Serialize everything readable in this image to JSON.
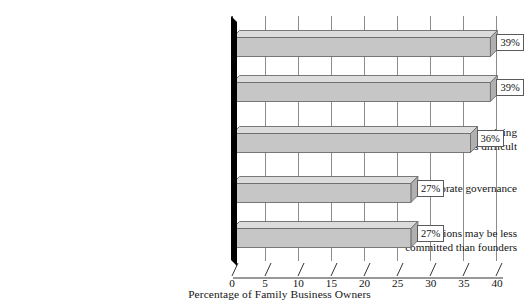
{
  "chart_data": {
    "type": "bar",
    "orientation": "horizontal",
    "style": "3d",
    "title": "",
    "xlabel": "Percentage of Family Business Owners",
    "ylabel": "",
    "xlim": [
      0,
      40
    ],
    "xticks": [
      0,
      5,
      10,
      15,
      20,
      25,
      30,
      35,
      40
    ],
    "xtick_labels": [
      "0",
      "5",
      "10",
      "15",
      "20",
      "25",
      "30",
      "35",
      "40"
    ],
    "grid": true,
    "grid_axis": "x",
    "legend": false,
    "value_label_suffix": "%",
    "categories": [
      "Potential for conflict among family members",
      "Difficulty separating home and work lives",
      "Potential for nepotism makes retaining\nqualified nonfamily employees difficult",
      "Potential for weak corporate governance",
      "Successive generations may be less\ncommitted than founders"
    ],
    "values": [
      39,
      39,
      36,
      27,
      27
    ],
    "value_labels": [
      "39%",
      "39%",
      "36%",
      "27%",
      "27%"
    ],
    "colors": {
      "bar_front": "#c6c6c6",
      "bar_top": "#dcdcdc",
      "bar_side": "#b0b0b0",
      "bar_outline": "#6b6b6b",
      "gridline": "#8c8c8c",
      "axis_wall": "#000000",
      "background": "#ffffff",
      "text": "#141414",
      "callout_background": "#ffffff",
      "callout_border": "#5a5a5a"
    }
  },
  "axis": {
    "title": "Percentage of Family Business Owners"
  }
}
